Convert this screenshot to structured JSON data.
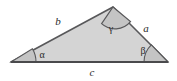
{
  "figure": {
    "type": "geometry-diagram",
    "shape": "triangle",
    "background_color": "#ffffff",
    "fill_color": "#d4d4d4",
    "stroke_color": "#58585a",
    "angle_marker_fill": "#c0c0c0",
    "label_color": "#2b2b2b",
    "vertices": {
      "left": {
        "x": 11,
        "y": 62
      },
      "top": {
        "x": 113,
        "y": 7
      },
      "right": {
        "x": 168,
        "y": 62
      }
    },
    "sides": [
      {
        "id": "a",
        "label": "a",
        "from": "top",
        "to": "right",
        "label_x": 146,
        "label_y": 29
      },
      {
        "id": "b",
        "label": "b",
        "from": "left",
        "to": "top",
        "label_x": 58,
        "label_y": 22
      },
      {
        "id": "c",
        "label": "c",
        "from": "left",
        "to": "right",
        "label_x": 92,
        "label_y": 73
      }
    ],
    "angles": [
      {
        "id": "alpha",
        "label": "α",
        "vertex": "left",
        "label_x": 42,
        "label_y": 56,
        "marker_radius": 25
      },
      {
        "id": "beta",
        "label": "β",
        "vertex": "right",
        "label_x": 143,
        "label_y": 52,
        "marker_radius": 24
      },
      {
        "id": "gamma",
        "label": "γ",
        "vertex": "top",
        "label_x": 111,
        "label_y": 30,
        "marker_radius": 20
      }
    ]
  }
}
